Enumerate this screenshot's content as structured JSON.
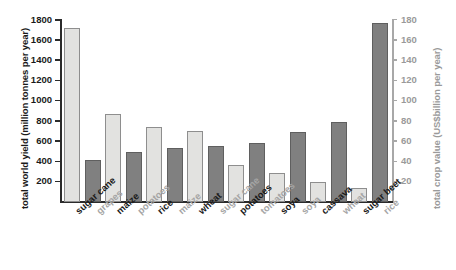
{
  "chart_data": {
    "type": "bar",
    "title": "",
    "grid": false,
    "legend": "none",
    "axes": {
      "left": {
        "label": "total world yield (million tonnes per year)",
        "ticks": [
          200,
          400,
          600,
          800,
          1000,
          1200,
          1400,
          1600,
          1800
        ],
        "lim": [
          0,
          1800
        ],
        "color": "#1a1a1a"
      },
      "right": {
        "label": "total crop value (US$billion per year)",
        "ticks": [
          20,
          40,
          60,
          80,
          100,
          120,
          140,
          160,
          180
        ],
        "lim": [
          0,
          180
        ],
        "color": "#9a9a9a"
      }
    },
    "series": [
      {
        "name": "total world yield (million tonnes per year)",
        "axis": "left",
        "color": "#e2e2e0"
      },
      {
        "name": "total crop value (US$billion per year)",
        "axis": "right",
        "color": "#808080"
      }
    ],
    "categories": [
      "sugar cane",
      "grapes",
      "maize",
      "potatoes",
      "rice",
      "maize",
      "wheat",
      "sugar cane",
      "potatoes",
      "tomatoes",
      "soya",
      "soya",
      "cassava",
      "wheat",
      "sugar beet",
      "rice"
    ],
    "bars": [
      {
        "label": "sugar cane",
        "series": "yield",
        "value": 1725,
        "unit": "million tonnes per year"
      },
      {
        "label": "grapes",
        "series": "value",
        "value": 42,
        "unit": "US$billion per year"
      },
      {
        "label": "maize",
        "series": "yield",
        "value": 870,
        "unit": "million tonnes per year"
      },
      {
        "label": "potatoes",
        "series": "value",
        "value": 49,
        "unit": "US$billion per year"
      },
      {
        "label": "rice",
        "series": "yield",
        "value": 745,
        "unit": "million tonnes per year"
      },
      {
        "label": "maize",
        "series": "value",
        "value": 53,
        "unit": "US$billion per year"
      },
      {
        "label": "wheat",
        "series": "yield",
        "value": 705,
        "unit": "million tonnes per year"
      },
      {
        "label": "sugar cane",
        "series": "value",
        "value": 55,
        "unit": "US$billion per year"
      },
      {
        "label": "potatoes",
        "series": "yield",
        "value": 365,
        "unit": "million tonnes per year"
      },
      {
        "label": "tomatoes",
        "series": "value",
        "value": 58,
        "unit": "US$billion per year"
      },
      {
        "label": "soya",
        "series": "yield",
        "value": 290,
        "unit": "million tonnes per year"
      },
      {
        "label": "soya",
        "series": "value",
        "value": 69,
        "unit": "US$billion per year"
      },
      {
        "label": "cassava",
        "series": "yield",
        "value": 195,
        "unit": "million tonnes per year"
      },
      {
        "label": "wheat",
        "series": "value",
        "value": 79,
        "unit": "US$billion per year"
      },
      {
        "label": "sugar beet",
        "series": "yield",
        "value": 140,
        "unit": "million tonnes per year"
      },
      {
        "label": "rice",
        "series": "value",
        "value": 177,
        "unit": "US$billion per year"
      }
    ]
  }
}
